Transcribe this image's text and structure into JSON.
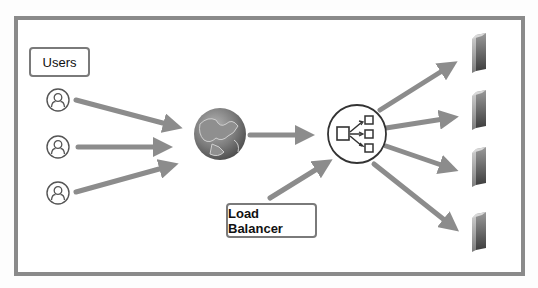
{
  "diagram": {
    "labels": {
      "users": "Users",
      "load_balancer": "Load Balancer"
    },
    "nodes": [
      {
        "id": "user-1",
        "type": "user-icon"
      },
      {
        "id": "user-2",
        "type": "user-icon"
      },
      {
        "id": "user-3",
        "type": "user-icon"
      },
      {
        "id": "internet",
        "type": "globe-icon"
      },
      {
        "id": "load-balancer",
        "type": "load-balancer-icon"
      },
      {
        "id": "server-1",
        "type": "server-icon"
      },
      {
        "id": "server-2",
        "type": "server-icon"
      },
      {
        "id": "server-3",
        "type": "server-icon"
      },
      {
        "id": "server-4",
        "type": "server-icon"
      }
    ],
    "edges": [
      {
        "from": "user-1",
        "to": "internet"
      },
      {
        "from": "user-2",
        "to": "internet"
      },
      {
        "from": "user-3",
        "to": "internet"
      },
      {
        "from": "internet",
        "to": "load-balancer"
      },
      {
        "from": "load-balancer-label",
        "to": "load-balancer"
      },
      {
        "from": "load-balancer",
        "to": "server-1"
      },
      {
        "from": "load-balancer",
        "to": "server-2"
      },
      {
        "from": "load-balancer",
        "to": "server-3"
      },
      {
        "from": "load-balancer",
        "to": "server-4"
      }
    ],
    "colors": {
      "frame": "#8a8a8a",
      "arrow": "#8c8c8c",
      "icon_stroke": "#555555"
    }
  }
}
